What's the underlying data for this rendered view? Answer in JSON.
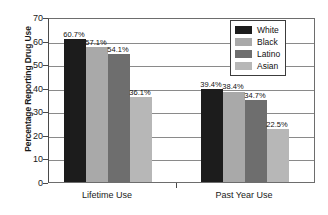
{
  "chart_data": {
    "type": "bar",
    "title": "",
    "xlabel": "",
    "ylabel": "Percentage Reporting Drug Use",
    "ylim": [
      0,
      70
    ],
    "ytick_step": 10,
    "yticks": [
      "0",
      "10",
      "20",
      "30",
      "40",
      "50",
      "60",
      "70"
    ],
    "grid": true,
    "legend_position": "top-right",
    "categories": [
      "Lifetime Use",
      "Past Year Use"
    ],
    "series": [
      {
        "name": "White",
        "color": "#1c1c1c",
        "values": [
          60.7,
          39.4
        ],
        "labels": [
          "60.7%",
          "39.4%"
        ]
      },
      {
        "name": "Black",
        "color": "#a9a9a9",
        "values": [
          57.1,
          38.4
        ],
        "labels": [
          "57.1%",
          "38.4%"
        ]
      },
      {
        "name": "Latino",
        "color": "#6e6e6e",
        "values": [
          54.1,
          34.7
        ],
        "labels": [
          "54.1%",
          "34.7%"
        ]
      },
      {
        "name": "Asian",
        "color": "#b7b7b7",
        "values": [
          36.1,
          22.5
        ],
        "labels": [
          "36.1%",
          "22.5%"
        ]
      }
    ]
  },
  "legend": {
    "items": [
      {
        "label": "White",
        "color": "#1c1c1c"
      },
      {
        "label": "Black",
        "color": "#a9a9a9"
      },
      {
        "label": "Latino",
        "color": "#6e6e6e"
      },
      {
        "label": "Asian",
        "color": "#b7b7b7"
      }
    ]
  }
}
